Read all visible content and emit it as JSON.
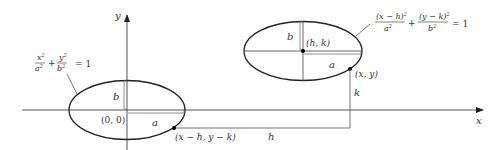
{
  "colors": {
    "curve": "#222222",
    "axis": "#555555",
    "guide": "#777777",
    "text": "#333333",
    "point": "#000000"
  },
  "axes": {
    "x_label": "x",
    "y_label": "y"
  },
  "origin_ellipse": {
    "center_label": "(0, 0)",
    "a_label": "a",
    "b_label": "b",
    "equation": {
      "term1_num": "x",
      "term1_num_exp": "2",
      "term1_den": "a",
      "term1_den_exp": "2",
      "plus": "+",
      "term2_num": "y",
      "term2_num_exp": "2",
      "term2_den": "b",
      "term2_den_exp": "2",
      "rhs": "= 1"
    },
    "point_label": "(x − h, y − k)"
  },
  "shifted_ellipse": {
    "center_label": "(h, k)",
    "a_label": "a",
    "b_label": "b",
    "equation": {
      "term1_num": "(x − h)",
      "term1_num_exp": "2",
      "term1_den": "a",
      "term1_den_exp": "2",
      "plus": "+",
      "term2_num": "(y − k)",
      "term2_num_exp": "2",
      "term2_den": "b",
      "term2_den_exp": "2",
      "rhs": "= 1"
    },
    "point_label": "(x, y)"
  },
  "translation": {
    "h_label": "h",
    "k_label": "k"
  }
}
